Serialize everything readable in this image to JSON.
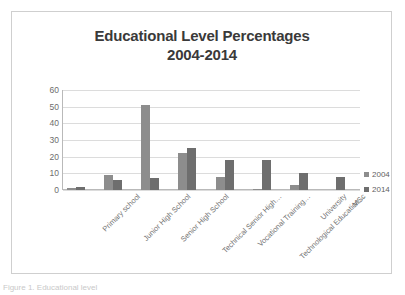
{
  "figure": {
    "caption": "Figure 1. Educational level"
  },
  "legend": {
    "position": "right",
    "items": [
      {
        "label": "2004",
        "color": "#8d8d8d"
      },
      {
        "label": "2014",
        "color": "#6e6e6e"
      }
    ]
  },
  "axis": {
    "y_ticks": [
      "0",
      "10",
      "20",
      "30",
      "40",
      "50",
      "60"
    ]
  },
  "chart_data": {
    "type": "bar",
    "title": "Educational Level Percentages 2004-2014",
    "title_line1": "Educational Level Percentages",
    "title_line2": "2004-2014",
    "xlabel": "",
    "ylabel": "",
    "ylim": [
      0,
      60
    ],
    "ytick_step": 10,
    "grid": true,
    "legend_position": "right",
    "categories": [
      "Primary school",
      "Junior High  School",
      "Senior High School",
      "Technical Senior High…",
      "Vocational Training…",
      "Technological Education…",
      "University",
      "MSc"
    ],
    "series": [
      {
        "name": "2004",
        "color": "#8d8d8d",
        "values": [
          1,
          9,
          51,
          22,
          8,
          0.5,
          3,
          0
        ]
      },
      {
        "name": "2014",
        "color": "#6e6e6e",
        "values": [
          2,
          6,
          7.5,
          25,
          18,
          18,
          10,
          8
        ]
      }
    ]
  }
}
